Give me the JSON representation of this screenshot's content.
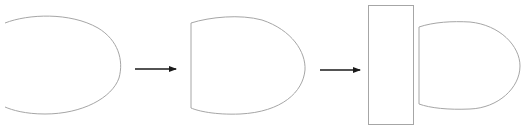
{
  "diagram": {
    "title": "",
    "colors": {
      "background": "#ffffff",
      "shape_stroke": "#a6a6a6",
      "arrow_stroke": "#1a1a1a"
    },
    "stages": [
      {
        "id": "stage-1",
        "shape": "open-ellipse-arc",
        "label": ""
      },
      {
        "id": "stage-2",
        "shape": "d-shape",
        "label": ""
      },
      {
        "id": "stage-3",
        "shape": "rectangle-plus-d-shape",
        "label": ""
      }
    ],
    "arrows": [
      {
        "from": "stage-1",
        "to": "stage-2",
        "direction": "right"
      },
      {
        "from": "stage-2",
        "to": "stage-3",
        "direction": "right"
      }
    ]
  }
}
